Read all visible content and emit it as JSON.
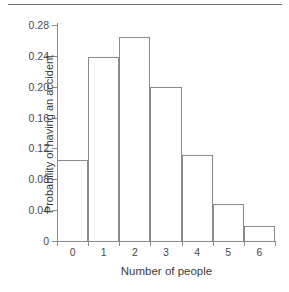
{
  "chart_data": {
    "type": "bar",
    "title": "",
    "xlabel": "Number of people",
    "ylabel": "Probability of having an accident",
    "categories": [
      "0",
      "1",
      "2",
      "3",
      "4",
      "5",
      "6"
    ],
    "values": [
      0.105,
      0.239,
      0.265,
      0.2,
      0.111,
      0.048,
      0.019
    ],
    "ylim": [
      0,
      0.28
    ],
    "xlim": [
      -0.5,
      6.5
    ],
    "ytick_labels": [
      "0.28",
      "0.24",
      "0.20",
      "0.16",
      "0.12",
      "0.08",
      "0.04",
      "0"
    ],
    "ytick_values": [
      0.28,
      0.24,
      0.2,
      0.16,
      0.12,
      0.08,
      0.04,
      0
    ],
    "xtick_labels": [
      "0",
      "1",
      "2",
      "3",
      "4",
      "5",
      "6"
    ],
    "grid": false,
    "legend": null,
    "bar_fill": "#ffffff",
    "bar_edge": "#8a8a8a"
  },
  "figure": {
    "top_rule": true
  }
}
